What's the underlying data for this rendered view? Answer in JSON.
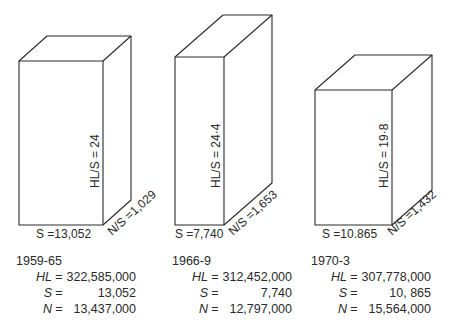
{
  "diagram": {
    "type": "3d-box-comparison",
    "boxes": [
      {
        "period": "1959-65",
        "hl_s_label": "HL/S = 24",
        "n_s_label": "N/S =1,029",
        "s_label": "S =13,052",
        "stats": {
          "HL": "322,585,000",
          "S": "13,052",
          "N": "13,437,000"
        }
      },
      {
        "period": "1966-9",
        "hl_s_label": "HL/S = 24·4",
        "n_s_label": "N/S =1,653",
        "s_label": "S =7,740",
        "stats": {
          "HL": "312,452,000",
          "S": "7,740",
          "N": "12,797,000"
        }
      },
      {
        "period": "1970-3",
        "hl_s_label": "HL/S = 19·8",
        "n_s_label": "N/S =1,432",
        "s_label": "S =10.865",
        "stats": {
          "HL": "307,778,000",
          "S": "10, 865",
          "N": "15,564,000"
        }
      }
    ],
    "keys": {
      "HL": "HL",
      "S": "S",
      "N": "N",
      "eq": "="
    }
  }
}
